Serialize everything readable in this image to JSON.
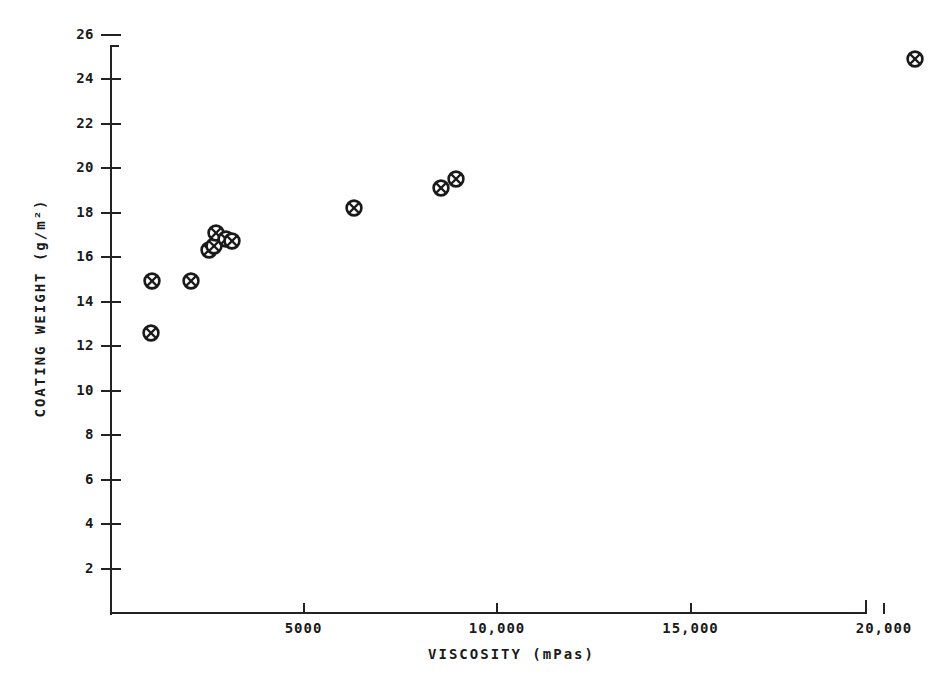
{
  "chart_data": {
    "type": "scatter",
    "title": "",
    "xlabel": "VISCOSITY (mPas)",
    "ylabel": "COATING WEIGHT (g/m²)",
    "xlim": [
      0,
      21500
    ],
    "ylim": [
      0,
      26.8
    ],
    "grid": false,
    "legend": null,
    "marker": "circle-with-cross",
    "x_ticks": [
      {
        "value": 5000,
        "label": "5000"
      },
      {
        "value": 10000,
        "label": "10,000"
      },
      {
        "value": 15000,
        "label": "15,000"
      },
      {
        "value": 20000,
        "label": "20,000"
      }
    ],
    "y_ticks": [
      {
        "value": 2,
        "label": "2"
      },
      {
        "value": 4,
        "label": "4"
      },
      {
        "value": 6,
        "label": "6"
      },
      {
        "value": 8,
        "label": "8"
      },
      {
        "value": 10,
        "label": "10"
      },
      {
        "value": 12,
        "label": "12"
      },
      {
        "value": 14,
        "label": "14"
      },
      {
        "value": 16,
        "label": "16"
      },
      {
        "value": 18,
        "label": "18"
      },
      {
        "value": 20,
        "label": "20"
      },
      {
        "value": 22,
        "label": "22"
      },
      {
        "value": 24,
        "label": "24"
      },
      {
        "value": 26,
        "label": "26"
      }
    ],
    "points": [
      {
        "x": 1050,
        "y": 12.6
      },
      {
        "x": 1080,
        "y": 14.9
      },
      {
        "x": 2100,
        "y": 14.9
      },
      {
        "x": 2550,
        "y": 16.3
      },
      {
        "x": 2700,
        "y": 16.5
      },
      {
        "x": 2750,
        "y": 17.1
      },
      {
        "x": 3000,
        "y": 16.8
      },
      {
        "x": 3150,
        "y": 16.7
      },
      {
        "x": 6300,
        "y": 18.2
      },
      {
        "x": 8550,
        "y": 19.1
      },
      {
        "x": 8950,
        "y": 19.5
      },
      {
        "x": 20800,
        "y": 24.9
      }
    ]
  },
  "axes": {
    "y_spine_top_value": 26.8,
    "x_spine_max_value": 21500
  }
}
